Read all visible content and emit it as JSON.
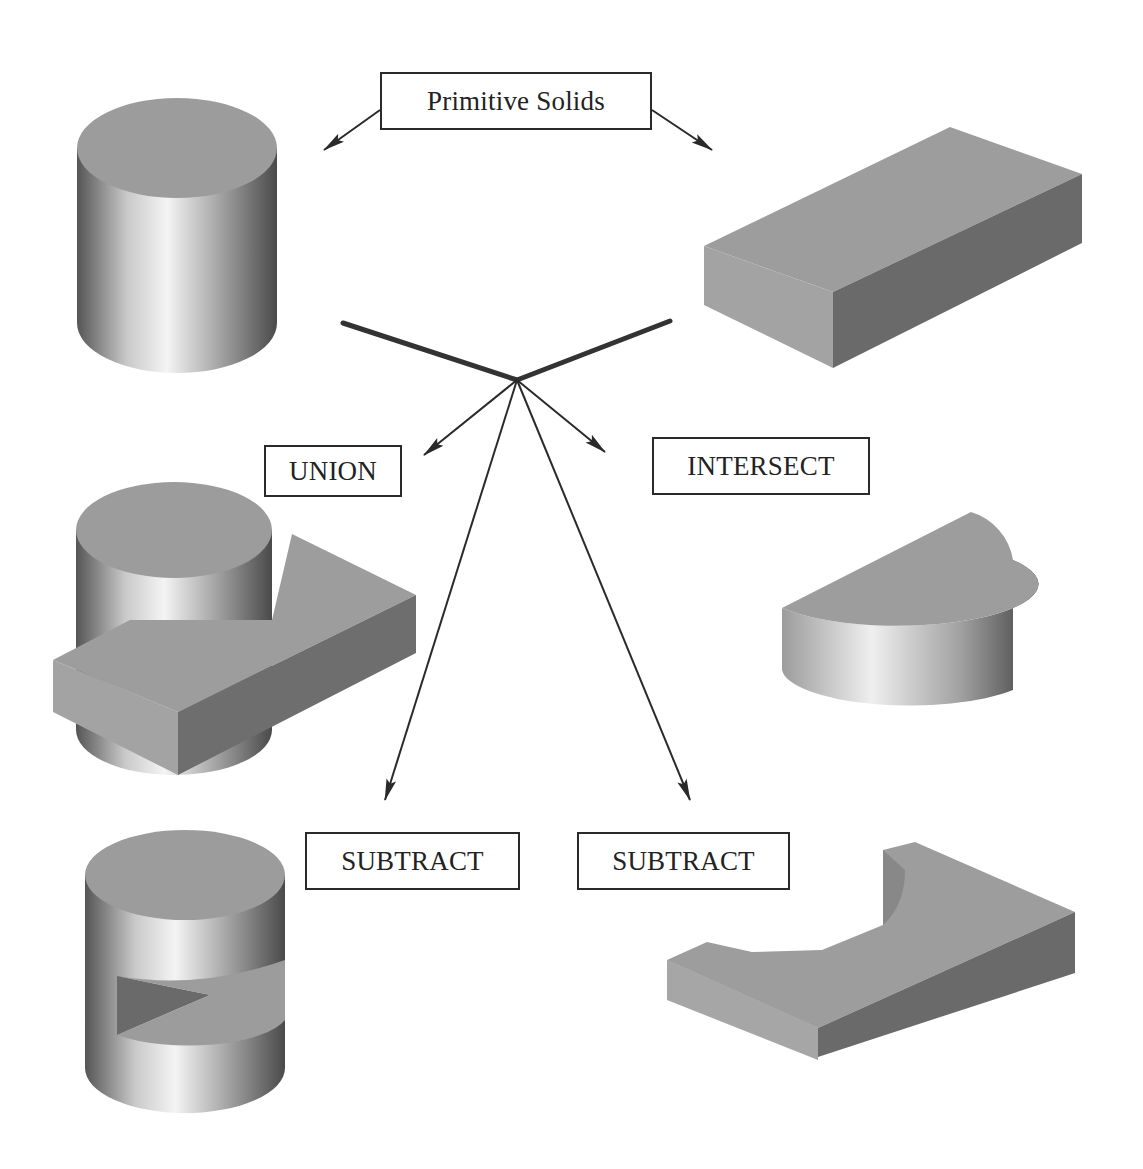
{
  "diagram": {
    "topic": "Constructive solid geometry boolean operations",
    "labels": {
      "primitives": "Primitive Solids",
      "union": "UNION",
      "intersect": "INTERSECT",
      "subtract_left": "SUBTRACT",
      "subtract_right": "SUBTRACT"
    },
    "solids": {
      "primitive_cylinder": "cylinder",
      "primitive_box": "rectangular block",
      "union_result": "cylinder joined with block",
      "intersect_result": "half-cylinder segment",
      "subtract_left_result": "cylinder with wedge slot removed",
      "subtract_right_result": "block with semicircular cutout"
    },
    "colors": {
      "top_face": "#9a9a9a",
      "side_light": "#f2f2f2",
      "side_dark": "#555555",
      "box_front_light": "#a4a4a4",
      "box_front_dark": "#707070",
      "line": "#2a2a2a"
    }
  }
}
